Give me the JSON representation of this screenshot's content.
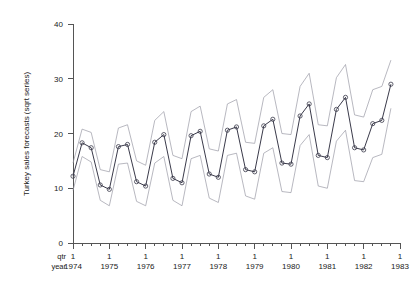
{
  "chart_data": {
    "type": "line",
    "title": "",
    "xlabel": "",
    "ylabel": "Turkey sales forecasts (sqrt series)",
    "ylim": [
      0,
      40
    ],
    "yticks": [
      0,
      10,
      20,
      30,
      40
    ],
    "ytick_labels": [
      "0",
      "10",
      "20",
      "30",
      "40"
    ],
    "grid": false,
    "legend": "none",
    "x_axis_row_labels": {
      "quarter": "qtr",
      "year": "year"
    },
    "year_labels": [
      "1974",
      "1975",
      "1976",
      "1977",
      "1978",
      "1979",
      "1980",
      "1981",
      "1982",
      "1983"
    ],
    "quarter_label": "1",
    "xlim_years": [
      1974,
      1983
    ],
    "x_tick_interval": "quarterly",
    "x": [
      1974.0,
      1974.25,
      1974.5,
      1974.75,
      1975.0,
      1975.25,
      1975.5,
      1975.75,
      1976.0,
      1976.25,
      1976.5,
      1976.75,
      1977.0,
      1977.25,
      1977.5,
      1977.75,
      1978.0,
      1978.25,
      1978.5,
      1978.75,
      1979.0,
      1979.25,
      1979.5,
      1979.75,
      1980.0,
      1980.25,
      1980.5,
      1980.75,
      1981.0,
      1981.25,
      1981.5,
      1981.75,
      1982.0,
      1982.25,
      1982.5,
      1982.75
    ],
    "series": [
      {
        "name": "forecast",
        "role": "center",
        "marker": "circle",
        "values": [
          12.2,
          18.3,
          17.4,
          10.6,
          9.8,
          17.6,
          18.0,
          11.2,
          10.4,
          18.4,
          19.8,
          11.8,
          11.0,
          19.6,
          20.4,
          12.6,
          12.0,
          20.6,
          21.2,
          13.4,
          13.0,
          21.4,
          22.6,
          14.6,
          14.4,
          23.2,
          25.4,
          16.0,
          15.6,
          24.4,
          26.6,
          17.4,
          17.0,
          21.8,
          22.4,
          29.0
        ]
      },
      {
        "name": "upper bound",
        "role": "upper",
        "marker": "none",
        "values": [
          14.6,
          20.8,
          20.2,
          13.4,
          13.0,
          21.0,
          21.6,
          15.0,
          14.2,
          22.4,
          24.0,
          16.0,
          15.4,
          24.0,
          25.0,
          17.2,
          16.8,
          25.4,
          26.2,
          18.4,
          18.2,
          26.6,
          28.0,
          20.0,
          19.8,
          28.6,
          31.0,
          21.6,
          21.4,
          30.2,
          32.6,
          23.4,
          23.0,
          28.0,
          28.6,
          33.4
        ]
      },
      {
        "name": "lower bound",
        "role": "lower",
        "marker": "none",
        "values": [
          9.6,
          15.8,
          14.8,
          7.8,
          6.8,
          14.4,
          14.6,
          7.6,
          6.8,
          14.6,
          15.8,
          7.8,
          6.8,
          15.4,
          16.0,
          8.2,
          7.4,
          16.0,
          16.4,
          8.6,
          8.0,
          16.4,
          17.4,
          9.4,
          9.2,
          17.8,
          19.8,
          10.4,
          10.0,
          18.6,
          20.6,
          11.4,
          11.2,
          15.6,
          16.2,
          24.6
        ]
      }
    ]
  }
}
